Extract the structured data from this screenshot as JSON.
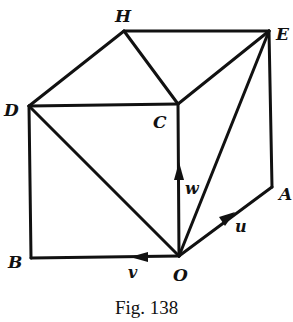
{
  "figure": {
    "caption": "Fig. 138",
    "stroke_color": "#111111",
    "background": "#ffffff"
  },
  "vertices": {
    "H": {
      "label": "H",
      "x": 124,
      "y": 31
    },
    "E": {
      "label": "E",
      "x": 269,
      "y": 31
    },
    "D": {
      "label": "D",
      "x": 29,
      "y": 106
    },
    "C": {
      "label": "C",
      "x": 178,
      "y": 104
    },
    "B": {
      "label": "B",
      "x": 31,
      "y": 258
    },
    "O": {
      "label": "O",
      "x": 179,
      "y": 256
    },
    "A": {
      "label": "A",
      "x": 272,
      "y": 187
    }
  },
  "vectors": {
    "u": {
      "label": "u",
      "from": "O",
      "to": "A"
    },
    "v": {
      "label": "v",
      "from": "O",
      "to": "B"
    },
    "w": {
      "label": "w",
      "from": "O",
      "to": "C"
    }
  },
  "edges": [
    [
      "H",
      "E"
    ],
    [
      "H",
      "D"
    ],
    [
      "H",
      "C"
    ],
    [
      "D",
      "C"
    ],
    [
      "C",
      "E"
    ],
    [
      "D",
      "B"
    ],
    [
      "D",
      "O"
    ],
    [
      "C",
      "O"
    ],
    [
      "O",
      "E"
    ],
    [
      "E",
      "A"
    ],
    [
      "O",
      "A"
    ],
    [
      "B",
      "O"
    ]
  ]
}
